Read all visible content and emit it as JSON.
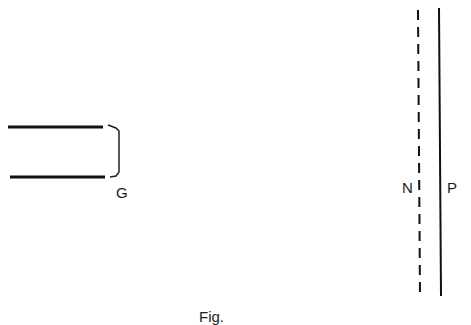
{
  "diagram": {
    "grid": {
      "label": "G",
      "plates": [
        {
          "x1": 8,
          "y": 127,
          "x2": 103
        },
        {
          "x1": 10,
          "y": 177,
          "x2": 105
        }
      ]
    },
    "screen_n": {
      "label": "N",
      "style": "dashed",
      "x": 419,
      "y1": 10,
      "y2": 296
    },
    "screen_p": {
      "label": "P",
      "style": "solid",
      "x": 440,
      "y1": 8,
      "y2": 296
    },
    "caption": "Fig."
  }
}
